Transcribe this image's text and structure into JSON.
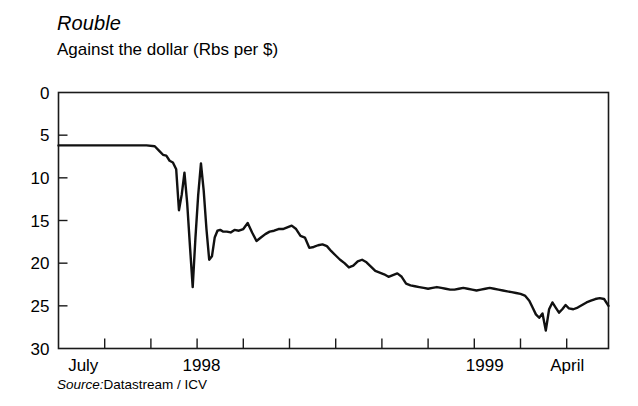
{
  "chart_data": {
    "type": "line",
    "title": "Rouble",
    "subtitle": "Against the dollar (Rbs per $)",
    "xlabel": "",
    "ylabel": "",
    "source_label": "Source:",
    "source_value": "Datastream / ICV",
    "grid": false,
    "legend": "none",
    "y_inverted": true,
    "ylim": [
      0,
      30
    ],
    "yticks": [
      0,
      5,
      10,
      15,
      20,
      25,
      30
    ],
    "ytick_labels": [
      "0",
      "5",
      "10",
      "15",
      "20",
      "25",
      "30"
    ],
    "xlim": [
      0,
      100
    ],
    "xtick_labels": [
      "July",
      "1998",
      "1999",
      "April"
    ],
    "xtick_positions": [
      4.5,
      26.0,
      77.5,
      92.5
    ],
    "xminor_tick_positions": [
      8.4,
      16.8,
      25.2,
      33.6,
      42.0,
      50.4,
      58.8,
      67.2,
      75.6,
      84.0,
      92.4
    ],
    "line_color": "#111111",
    "line_width": 2.4,
    "series": [
      {
        "name": "Rouble per US dollar",
        "x": [
          0.0,
          2.0,
          4.0,
          6.0,
          8.0,
          10.0,
          12.0,
          14.0,
          16.0,
          17.5,
          18.4,
          19.0,
          19.6,
          20.2,
          20.8,
          21.4,
          21.9,
          22.4,
          22.9,
          23.4,
          23.9,
          24.4,
          24.9,
          25.4,
          25.9,
          26.4,
          26.9,
          27.4,
          27.9,
          28.4,
          28.9,
          29.4,
          29.9,
          30.6,
          31.3,
          32.0,
          32.8,
          33.6,
          34.4,
          35.2,
          36.0,
          36.8,
          37.6,
          38.4,
          39.2,
          40.0,
          40.8,
          41.6,
          42.4,
          43.2,
          44.0,
          44.8,
          45.6,
          46.4,
          47.2,
          48.0,
          48.8,
          49.6,
          50.4,
          51.2,
          52.0,
          52.8,
          53.6,
          54.4,
          55.2,
          56.0,
          56.8,
          57.6,
          58.4,
          59.2,
          60.0,
          60.8,
          61.6,
          62.4,
          63.2,
          64.0,
          64.8,
          65.6,
          66.4,
          67.2,
          68.0,
          68.8,
          69.6,
          70.4,
          71.2,
          72.0,
          72.8,
          73.6,
          74.4,
          75.2,
          76.0,
          76.8,
          77.6,
          78.4,
          79.2,
          80.0,
          80.8,
          81.6,
          82.4,
          83.2,
          84.0,
          84.8,
          85.6,
          86.2,
          86.8,
          87.4,
          88.0,
          88.6,
          89.2,
          89.8,
          90.4,
          91.0,
          91.6,
          92.2,
          92.8,
          93.6,
          94.4,
          95.2,
          96.0,
          96.8,
          97.6,
          98.4,
          99.2,
          100.0
        ],
        "values": [
          6.2,
          6.2,
          6.2,
          6.2,
          6.2,
          6.2,
          6.2,
          6.2,
          6.2,
          6.3,
          6.9,
          7.3,
          7.4,
          8.0,
          8.2,
          9.0,
          13.8,
          12.0,
          9.4,
          13.0,
          18.0,
          22.8,
          17.0,
          12.0,
          8.3,
          11.5,
          16.0,
          19.6,
          19.2,
          17.0,
          16.2,
          16.1,
          16.3,
          16.3,
          16.4,
          16.1,
          16.2,
          16.0,
          15.3,
          16.4,
          17.4,
          17.0,
          16.6,
          16.3,
          16.2,
          16.0,
          16.0,
          15.8,
          15.6,
          16.0,
          16.8,
          17.0,
          18.2,
          18.1,
          17.9,
          17.8,
          18.0,
          18.6,
          19.1,
          19.6,
          20.0,
          20.5,
          20.3,
          19.8,
          19.6,
          19.9,
          20.4,
          20.9,
          21.1,
          21.3,
          21.6,
          21.4,
          21.2,
          21.6,
          22.4,
          22.6,
          22.7,
          22.8,
          22.9,
          23.0,
          22.9,
          22.8,
          22.9,
          23.0,
          23.1,
          23.1,
          23.0,
          22.9,
          23.0,
          23.1,
          23.2,
          23.1,
          23.0,
          22.9,
          23.0,
          23.1,
          23.2,
          23.3,
          23.4,
          23.5,
          23.6,
          23.8,
          24.4,
          25.2,
          26.0,
          26.4,
          25.9,
          27.9,
          25.4,
          24.6,
          25.2,
          25.8,
          25.4,
          24.9,
          25.3,
          25.4,
          25.2,
          24.9,
          24.6,
          24.4,
          24.2,
          24.1,
          24.2,
          25.0
        ]
      }
    ]
  }
}
